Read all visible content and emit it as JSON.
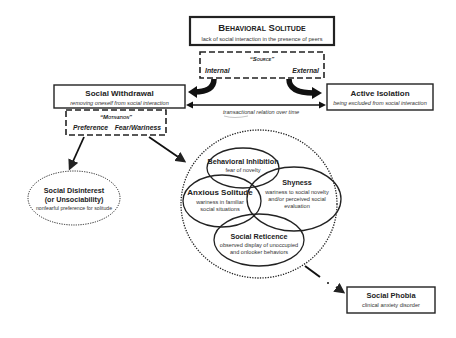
{
  "diagram": {
    "behavioral_solitude": {
      "title": "Behavioral Solitude",
      "subtitle": "lack of social interaction in the presence of peers"
    },
    "source": {
      "header": "“Source”",
      "internal": "Internal",
      "external": "External"
    },
    "social_withdrawal": {
      "title": "Social Withdrawal",
      "subtitle": "removing oneself from social interaction"
    },
    "active_isolation": {
      "title": "Active Isolation",
      "subtitle": "being excluded from social interaction"
    },
    "transactional": "transactional relation over time",
    "motivation": {
      "header": "“Motivation”",
      "preference": "Preference",
      "fear": "Fear/Wariness"
    },
    "social_disinterest": {
      "title_line1": "Social Disinterest",
      "title_line2": "(or Unsociability)",
      "subtitle": "nonfearful preference for solitude"
    },
    "behavioral_inhibition": {
      "title": "Behavioral Inhibition",
      "subtitle": "fear of novelty"
    },
    "anxious_solitude": {
      "title": "Anxious Solitude",
      "subtitle_line1": "wariness in familiar",
      "subtitle_line2": "social situations"
    },
    "shyness": {
      "title": "Shyness",
      "subtitle_line1": "wariness to social novelty",
      "subtitle_line2": "and/or perceived social",
      "subtitle_line3": "evaluation"
    },
    "social_reticence": {
      "title": "Social Reticence",
      "subtitle_line1": "observed display of unoccupied",
      "subtitle_line2": "and onlooker behaviors"
    },
    "social_phobia": {
      "title": "Social Phobia",
      "subtitle": "clinical anxiety disorder"
    }
  }
}
